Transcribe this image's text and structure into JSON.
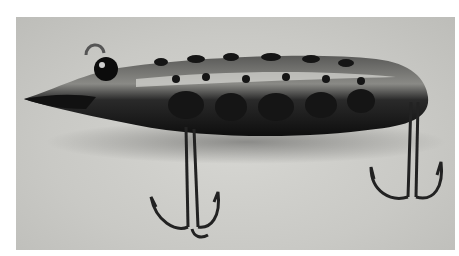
{
  "image": {
    "subject": "Vintage fishing lure with spotted finish and two treble hooks",
    "style": "grayscale photograph",
    "colors": {
      "background": "#cacac6",
      "body_dark": "#1c1c1c",
      "body_mid": "#4a4a48",
      "highlight": "#e8e8e6",
      "margin": "#ffffff"
    }
  }
}
